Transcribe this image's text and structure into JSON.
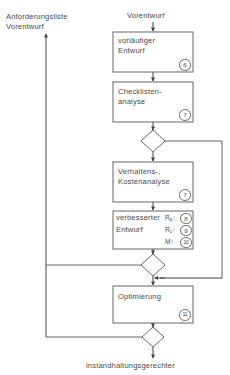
{
  "diagram": {
    "title_label": "Vorentwurf",
    "input_label_line1": "Anforderungsliste",
    "input_label_line2": "Vorentwurf",
    "output_label": "instandhaltungsgerechter",
    "boxes": [
      {
        "id": "vorlaeufiger-entwurf",
        "line1": "vorläufiger",
        "line2": "Entwurf",
        "badge": "6"
      },
      {
        "id": "checklistenanalyse",
        "line1": "Checklisten-",
        "line2": "analyse",
        "badge": "7"
      },
      {
        "id": "verhaltens-kostenanalyse",
        "line1": "Verhaltens-,",
        "line2": "Kostenanalyse",
        "badge": "7"
      },
      {
        "id": "verbesserter-entwurf",
        "line1": "verbesserter",
        "line2": "Entwurf",
        "metric1_name": "R",
        "metric1_sub": "p",
        "metric1_arrow": "↑",
        "metric1_badge": "8",
        "metric2_name": "R",
        "metric2_sub": "c",
        "metric2_arrow": "↑",
        "metric2_badge": "9",
        "metric3_name": "M",
        "metric3_arrow": "↑",
        "metric3_badge": "10"
      },
      {
        "id": "optimierung",
        "line1": "Optimierung",
        "badge": "11"
      }
    ],
    "decisions": [
      {
        "id": "decision-1"
      },
      {
        "id": "decision-2"
      },
      {
        "id": "decision-3"
      }
    ],
    "colors": {
      "line": "#555555",
      "text": "#4a4a4a",
      "background": "#ffffff"
    }
  }
}
